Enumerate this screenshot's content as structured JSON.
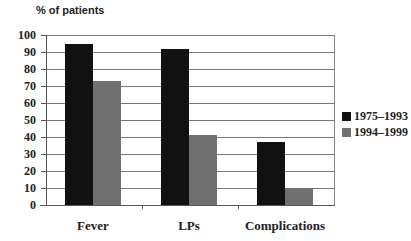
{
  "chart_data": {
    "type": "bar",
    "title": "",
    "ylabel": "% of patients",
    "xlabel": "",
    "categories": [
      "Fever",
      "LPs",
      "Complications"
    ],
    "series": [
      {
        "name": "1975–1993",
        "color": "#111111",
        "values": [
          95,
          92,
          37
        ]
      },
      {
        "name": "1994–1999",
        "color": "#707070",
        "values": [
          73,
          41,
          10
        ]
      }
    ],
    "ylim": [
      0,
      100
    ],
    "yticks": [
      "0",
      "10",
      "20",
      "30",
      "40",
      "50",
      "60",
      "70",
      "80",
      "90",
      "100"
    ],
    "grid": true,
    "legend_position": "right"
  }
}
